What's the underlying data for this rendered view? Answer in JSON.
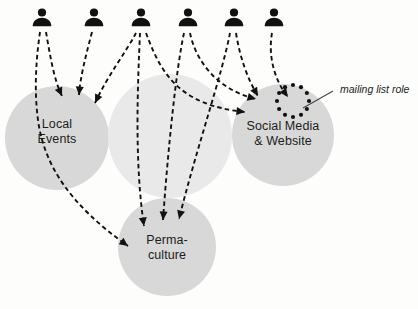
{
  "diagram": {
    "background_color": "#fdfdfb",
    "circle_fill_dark": "#d8d8d8",
    "circle_fill_light": "#e9e9e9",
    "ink_color": "#111111",
    "circles": [
      {
        "name": "local-events",
        "label": "Local\nEvents",
        "cx": 57,
        "cy": 138,
        "r": 52,
        "shade": "dark",
        "label_x": 19,
        "label_y": 117
      },
      {
        "name": "unlabeled-middle",
        "label": "",
        "cx": 170,
        "cy": 136,
        "r": 62,
        "shade": "light",
        "label_x": 0,
        "label_y": 0
      },
      {
        "name": "social-media-website",
        "label": "Social Media\n& Website",
        "cx": 283,
        "cy": 135,
        "r": 51,
        "shade": "dark",
        "label_x": 235,
        "label_y": 119
      },
      {
        "name": "permaculture",
        "label": "Perma-\nculture",
        "cx": 167,
        "cy": 247,
        "r": 49,
        "shade": "dark",
        "label_x": 134,
        "label_y": 233
      }
    ],
    "people": [
      {
        "name": "person-1",
        "cx": 42,
        "cy": 20
      },
      {
        "name": "person-2",
        "cx": 94,
        "cy": 20
      },
      {
        "name": "person-3",
        "cx": 141,
        "cy": 20
      },
      {
        "name": "person-4",
        "cx": 188,
        "cy": 20
      },
      {
        "name": "person-5",
        "cx": 234,
        "cy": 20
      },
      {
        "name": "person-6",
        "cx": 274,
        "cy": 20
      }
    ],
    "role_marker": {
      "name": "mailing-list-role-marker",
      "cx": 293,
      "cy": 101,
      "ring_radius": 16,
      "dot_count": 12,
      "dot_radius": 2.1
    },
    "annotation": {
      "name": "mailing-list-role-annotation",
      "text": "mailing list role",
      "text_x": 340,
      "text_y": 83,
      "leader_from_x": 333,
      "leader_from_y": 91,
      "leader_to_x": 303,
      "leader_to_y": 108
    },
    "connections": [
      {
        "name": "person-1-to-local-events",
        "path": "M 40,32 C 36,60 34,90 38,120 C 44,165 70,205 128,246",
        "arrow_at": "end",
        "arrow_angle": 38
      },
      {
        "name": "person-1-to-local-events-b",
        "path": "M 46,32 C 50,55 54,80 62,96",
        "arrow_at": "end",
        "arrow_angle": 62
      },
      {
        "name": "person-2-to-local-events",
        "path": "M 92,32 C 86,55 80,78 79,95",
        "arrow_at": "end",
        "arrow_angle": 87
      },
      {
        "name": "person-3-to-local-events",
        "path": "M 136,33 C 126,52 108,75 95,103",
        "arrow_at": "end",
        "arrow_angle": 117
      },
      {
        "name": "person-3-to-permaculture",
        "path": "M 140,33 C 138,80 134,160 144,226",
        "arrow_at": "end",
        "arrow_angle": 81
      },
      {
        "name": "person-3-to-social-media",
        "path": "M 146,33 C 160,70 176,105 245,112",
        "arrow_at": "end",
        "arrow_angle": 8
      },
      {
        "name": "person-4-to-permaculture",
        "path": "M 184,33 C 176,70 168,150 163,220",
        "arrow_at": "end",
        "arrow_angle": 90
      },
      {
        "name": "person-4-to-social-media",
        "path": "M 190,33 C 196,62 218,90 256,99",
        "arrow_at": "end",
        "arrow_angle": 15
      },
      {
        "name": "person-5-to-permaculture",
        "path": "M 230,33 C 222,75 196,150 179,219",
        "arrow_at": "end",
        "arrow_angle": 100
      },
      {
        "name": "person-5-to-social-media",
        "path": "M 236,33 C 240,58 248,80 258,96",
        "arrow_at": "end",
        "arrow_angle": 60
      },
      {
        "name": "person-6-to-mailing-list",
        "path": "M 272,33 C 268,55 274,80 288,97",
        "arrow_at": "end",
        "arrow_angle": 52
      }
    ]
  }
}
